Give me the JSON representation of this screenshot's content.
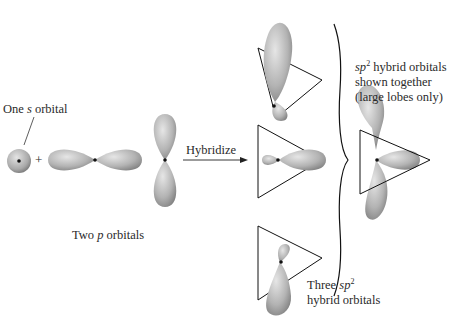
{
  "diagram": {
    "type": "sp2 hybridization schematic",
    "labels": {
      "s_orbital": {
        "pre": "One ",
        "italic": "s",
        "post": " orbital"
      },
      "p_orbitals": {
        "pre": "Two ",
        "italic": "p",
        "post": " orbitals"
      },
      "plus": "+",
      "arrow": "Hybridize",
      "three_sp2": {
        "pre": "Three ",
        "italic": "sp",
        "sup": "2",
        "line2": "hybrid orbitals"
      },
      "together": {
        "italic": "sp",
        "sup": "2",
        "post": " hybrid orbitals",
        "line2": "shown together",
        "line3": "(large lobes only)"
      }
    },
    "colors": {
      "lobe_light": "#d9d9d9",
      "lobe_dark": "#8a8a8a",
      "outline": "#1a1a1a",
      "text": "#2a2a2a"
    }
  }
}
